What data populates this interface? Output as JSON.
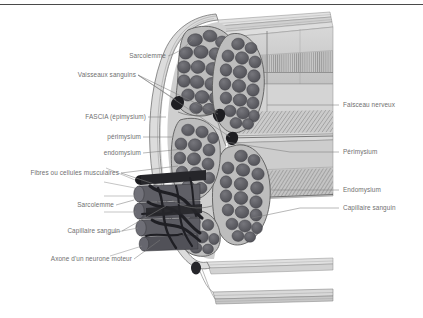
{
  "figure": {
    "language": "fr",
    "top_rule_color": "#4a4a4a",
    "label_color": "#6f6f6f",
    "leader_color": "#7d7d7d",
    "background_color": "#ffffff"
  },
  "labels_left": [
    {
      "id": "sarcolemme-top",
      "text": "Sarcolemme"
    },
    {
      "id": "vaisseaux-sanguins",
      "text": "Vaisseaux sanguins"
    },
    {
      "id": "fascia-epimysium",
      "text": "FASCIA (épimysium)"
    },
    {
      "id": "perimysium-left",
      "text": "périmysium"
    },
    {
      "id": "endomysium-left",
      "text": "endomysium"
    },
    {
      "id": "fibres-cellules-musculaires",
      "text": "Fibres ou cellules musculaires"
    },
    {
      "id": "sarcolemme-bottom",
      "text": "Sarcolemme"
    },
    {
      "id": "capillaire-sanguin-left",
      "text": "Capillaire sanguin"
    },
    {
      "id": "axone-neurone-moteur",
      "text": "Axone d'un neurone moteur"
    }
  ],
  "labels_right": [
    {
      "id": "faisceau-nerveux",
      "text": "Faisceau nerveux"
    },
    {
      "id": "perimysium-right",
      "text": "Périmysium"
    },
    {
      "id": "endomysium-right",
      "text": "Endomysium"
    },
    {
      "id": "capillaire-sanguin-right",
      "text": "Capillaire sanguin"
    }
  ],
  "structures": {
    "fascia_sheath": "Gaine de fascia (épimysium) entourant le muscle",
    "fascicles": "Faisceaux de fibres musculaires",
    "muscle_fibers": "Fibres musculaires polygonales en coupe",
    "nerve_bundle": "Faisceau nerveux avec axones",
    "capillary_network": "Réseau capillaire sombre ramifié",
    "fiber_cylinders": "Fibres musculaires cylindriques en vue longitudinale"
  },
  "palette": {
    "fiber_dark": "#55555a",
    "fiber_mid": "#6a6a70",
    "perimysium_light": "#d2d2d2",
    "sheet_gray": "#c6c6c6",
    "sheet_light": "#dcdcdc",
    "outline": "#4e4e52",
    "axon_black": "#26262a"
  }
}
